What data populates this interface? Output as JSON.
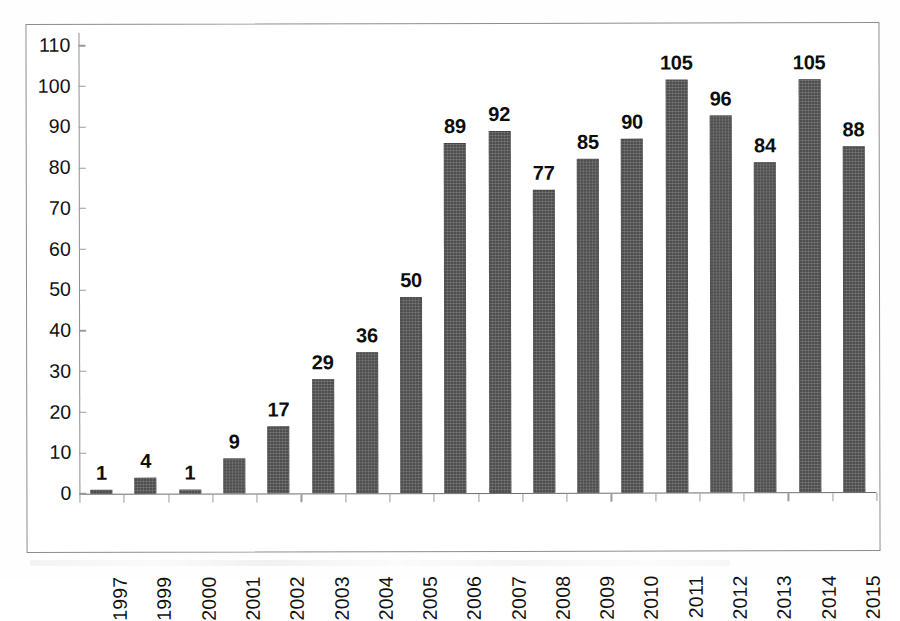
{
  "chart_data": {
    "type": "bar",
    "title": "",
    "subtitle": "",
    "xlabel": "",
    "ylabel": "",
    "categories": [
      "1997",
      "1999",
      "2000",
      "2001",
      "2002",
      "2003",
      "2004",
      "2005",
      "2006",
      "2007",
      "2008",
      "2009",
      "2010",
      "2011",
      "2012",
      "2013",
      "2014",
      "2015"
    ],
    "values": [
      1,
      4,
      1,
      9,
      17,
      29,
      36,
      50,
      89,
      92,
      77,
      85,
      90,
      105,
      96,
      84,
      105,
      88
    ],
    "data_labels": [
      "1",
      "4",
      "1",
      "9",
      "17",
      "29",
      "36",
      "50",
      "89",
      "92",
      "77",
      "85",
      "90",
      "105",
      "96",
      "84",
      "105",
      "88"
    ],
    "ylim": [
      0,
      110
    ],
    "ytick_values": [
      0,
      10,
      20,
      30,
      40,
      50,
      60,
      70,
      80,
      90,
      100,
      110
    ],
    "ytick_labels": [
      "0",
      "10",
      "20",
      "30",
      "40",
      "50",
      "60",
      "70",
      "80",
      "90",
      "100",
      "110"
    ],
    "grid": false,
    "legend": null,
    "legend_position": "none",
    "annotations": [],
    "series": [
      {
        "name": "",
        "values": [
          1,
          4,
          1,
          9,
          17,
          29,
          36,
          50,
          89,
          92,
          77,
          85,
          90,
          105,
          96,
          84,
          105,
          88
        ]
      }
    ],
    "colors": {
      "bar_fill": "#4e4e4e",
      "axis_line": "#8f8f8f",
      "frame_border": "#8d8d8d",
      "label_text": "#0d0d0d",
      "tick_text": "#111111",
      "background": "#ffffff"
    }
  }
}
